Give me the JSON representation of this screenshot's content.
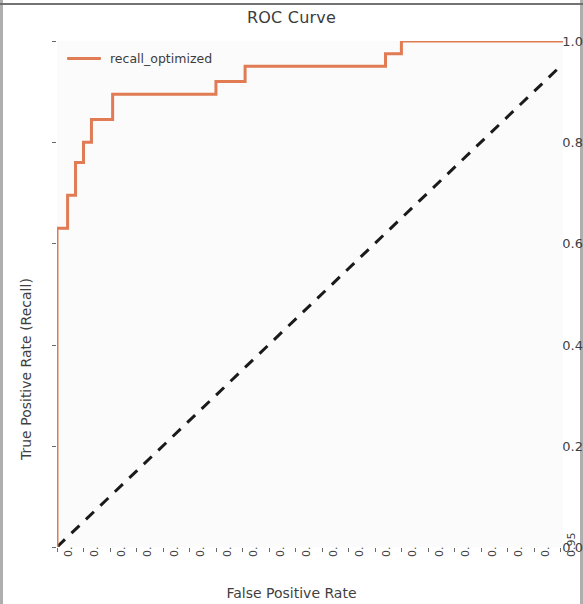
{
  "chart_data": {
    "type": "line",
    "title": "ROC Curve",
    "xlabel": "False Positive Rate",
    "ylabel": "True Positive Rate (Recall)",
    "xlim": [
      0.0,
      0.955
    ],
    "ylim": [
      0.0,
      1.0
    ],
    "grid": false,
    "legend_position": "upper left",
    "xticks": [
      "0.00",
      "0.05",
      "0.10",
      "0.15",
      "0.20",
      "0.25",
      "0.30",
      "0.35",
      "0.40",
      "0.45",
      "0.50",
      "0.55",
      "0.60",
      "0.65",
      "0.70",
      "0.75",
      "0.80",
      "0.85",
      "0.90",
      "0.95"
    ],
    "xtick_values": [
      0.0,
      0.05,
      0.1,
      0.15,
      0.2,
      0.25,
      0.3,
      0.35,
      0.4,
      0.45,
      0.5,
      0.55,
      0.6,
      0.65,
      0.7,
      0.75,
      0.8,
      0.85,
      0.9,
      0.95
    ],
    "yticks": [
      "0.0",
      "0.2",
      "0.4",
      "0.6",
      "0.8",
      "1.0"
    ],
    "ytick_values": [
      0.0,
      0.2,
      0.4,
      0.6,
      0.8,
      1.0
    ],
    "series": [
      {
        "name": "recall_optimized",
        "color": "#e07b54",
        "linestyle": "solid",
        "drawstyle": "steps-post",
        "x": [
          0.0,
          0.0,
          0.02,
          0.02,
          0.035,
          0.035,
          0.05,
          0.05,
          0.065,
          0.065,
          0.105,
          0.105,
          0.3,
          0.3,
          0.355,
          0.355,
          0.62,
          0.62,
          0.65,
          0.65,
          0.955
        ],
        "y": [
          0.0,
          0.63,
          0.63,
          0.695,
          0.695,
          0.76,
          0.76,
          0.8,
          0.8,
          0.845,
          0.845,
          0.895,
          0.895,
          0.92,
          0.92,
          0.95,
          0.95,
          0.975,
          0.975,
          1.0,
          1.0
        ]
      },
      {
        "name": "chance",
        "color": "#1a1a1a",
        "linestyle": "dashed",
        "x": [
          0.0,
          0.955
        ],
        "y": [
          0.0,
          0.955
        ]
      }
    ]
  },
  "chart": {
    "title": "ROC Curve",
    "xlabel": "False Positive Rate",
    "ylabel": "True Positive Rate (Recall)",
    "legend": {
      "entries": [
        {
          "label": "recall_optimized",
          "color": "#e07b54"
        }
      ]
    },
    "accent_color": "#e07b54",
    "chance_line_color": "#1a1a1a",
    "plot_background": "#fbfbfc"
  }
}
